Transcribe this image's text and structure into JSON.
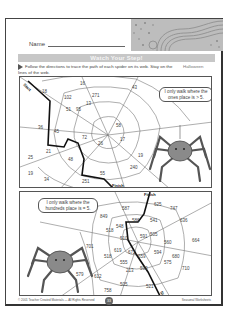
{
  "worksheet": {
    "name_label": "Name",
    "title": "Watch Your Step!",
    "directions": "Follow the directions to trace the path of each spider on its web. Stay on the lines of the web.",
    "theme": "Halloween",
    "top_web": {
      "start_label": "Start",
      "finish_label": "Finish",
      "speech": "I only walk where the ones place is > 5.",
      "numbers": [
        "18",
        "102",
        "271",
        "16",
        "43",
        "51",
        "95",
        "13",
        "36",
        "45",
        "21",
        "72",
        "26",
        "48",
        "58",
        "17",
        "19",
        "25",
        "34",
        "251",
        "55",
        "240",
        "19"
      ]
    },
    "bottom_web": {
      "start_label": "Start",
      "finish_label": "Finish",
      "speech": "I only walk where the hundreds place is = 5.",
      "numbers": [
        "587",
        "625",
        "747",
        "849",
        "548",
        "586",
        "541",
        "636",
        "591",
        "510",
        "518",
        "505",
        "560",
        "664",
        "701",
        "619",
        "672",
        "518",
        "555",
        "659",
        "594",
        "213",
        "590",
        "575",
        "680",
        "710",
        "579",
        "612",
        "758",
        "505",
        "521"
      ]
    },
    "footer": {
      "copyright": "© 2001 Teacher Created Materials — All Rights Reserved",
      "page_number": "33",
      "right_text": "Seasonal Worksheets"
    }
  },
  "colors": {
    "title_bar": "#c7c7c7",
    "header_art": "#bdbdbd",
    "path_line": "#111111",
    "border": "#444444"
  }
}
